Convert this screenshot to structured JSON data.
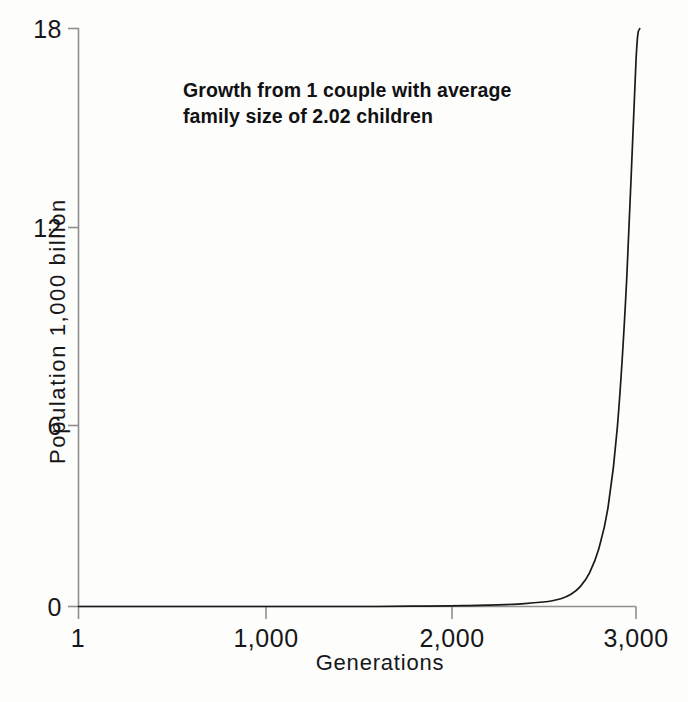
{
  "chart_data": {
    "type": "line",
    "title": "Growth from 1 couple with average family size of 2.02 children",
    "title_line1": "Growth from 1 couple with average",
    "title_line2": "family size of 2.02 children",
    "xlabel": "Generations",
    "ylabel": "Population 1,000 billion",
    "xlim": [
      1,
      3000
    ],
    "ylim": [
      0,
      18
    ],
    "xticks": [
      1,
      1000,
      2000,
      3000
    ],
    "xticklabels": [
      "1",
      "1,000",
      "2,000",
      "3,000"
    ],
    "yticks": [
      0,
      6,
      12,
      18
    ],
    "yticklabels": [
      "0",
      "6",
      "12",
      "18"
    ],
    "grid": false,
    "legend": null,
    "line_color": "#1a1a1a",
    "axis_color": "#8a8a8a",
    "background_color": "#fdfdfb",
    "series": [
      {
        "name": "Population",
        "x": [
          1,
          200,
          400,
          600,
          800,
          1000,
          1200,
          1400,
          1600,
          1800,
          2000,
          2100,
          2200,
          2300,
          2400,
          2500,
          2550,
          2600,
          2650,
          2700,
          2750,
          2800,
          2850,
          2900,
          2950,
          3000,
          3020
        ],
        "values": [
          0.0,
          0.0,
          0.0,
          0.0,
          0.0,
          0.0,
          0.0,
          0.0,
          0.0,
          0.01,
          0.02,
          0.03,
          0.04,
          0.06,
          0.09,
          0.14,
          0.18,
          0.25,
          0.38,
          0.62,
          1.05,
          1.8,
          3.1,
          5.6,
          10.2,
          17.0,
          18.0
        ]
      }
    ]
  },
  "axis": {
    "y_labels": [
      "18",
      "12",
      "6",
      "0"
    ],
    "x_labels": [
      "1",
      "1,000",
      "2,000",
      "3,000"
    ]
  }
}
